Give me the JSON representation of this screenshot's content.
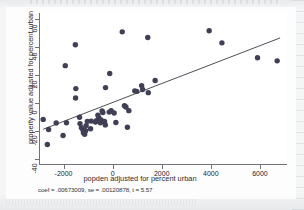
{
  "figure": {
    "note": "coef = .00673009, se = .00120878, t = 5.57"
  },
  "chart_data": {
    "type": "scatter",
    "title": "",
    "xlabel": "popden adjusted for percent urban",
    "ylabel": "property value adjusted for percent urban",
    "xlim": [
      -3000,
      7100
    ],
    "ylim": [
      -44,
      64
    ],
    "xticks": [
      -2000,
      0,
      2000,
      4000,
      6000
    ],
    "xtick_labels": [
      "-2000",
      "0",
      "2000",
      "4000",
      "6000"
    ],
    "yticks": [
      -40,
      -20,
      0,
      20,
      40,
      60
    ],
    "ytick_labels": [
      "-40",
      "-20",
      "0",
      "20",
      "40",
      "60"
    ],
    "grid": false,
    "legend": "none",
    "marker_color": "#3f3f55",
    "line_color": "#3a3a44",
    "fit_line": {
      "label": "linear fit",
      "coef": 0.00673009,
      "se": 0.00120878,
      "t": 5.57,
      "x_start": -2830,
      "y_start": -18.6,
      "x_end": 6820,
      "y_end": 46.3
    },
    "points": [
      {
        "x": -2830,
        "y": -11.6
      },
      {
        "x": -2660,
        "y": -29.4
      },
      {
        "x": -2610,
        "y": -18.8
      },
      {
        "x": -2300,
        "y": -14.2
      },
      {
        "x": -2020,
        "y": -23.0
      },
      {
        "x": -1930,
        "y": 26.6
      },
      {
        "x": -1880,
        "y": -14.0
      },
      {
        "x": -1520,
        "y": 41.4
      },
      {
        "x": -1500,
        "y": 10.3
      },
      {
        "x": -1510,
        "y": 3.6
      },
      {
        "x": -1350,
        "y": -10.1
      },
      {
        "x": -1330,
        "y": -14.6
      },
      {
        "x": -1270,
        "y": -17.5
      },
      {
        "x": -1210,
        "y": -19.0
      },
      {
        "x": -1190,
        "y": -21.1
      },
      {
        "x": -1160,
        "y": -20.0
      },
      {
        "x": -1140,
        "y": -22.2
      },
      {
        "x": -1100,
        "y": -19.7
      },
      {
        "x": -1080,
        "y": -16.0
      },
      {
        "x": -1030,
        "y": -13.0
      },
      {
        "x": -900,
        "y": -18.2
      },
      {
        "x": -870,
        "y": -12.8
      },
      {
        "x": -700,
        "y": -13.4
      },
      {
        "x": -660,
        "y": -12.6
      },
      {
        "x": -600,
        "y": -8.7
      },
      {
        "x": -560,
        "y": -10.5
      },
      {
        "x": -520,
        "y": -12.2
      },
      {
        "x": -500,
        "y": -14.0
      },
      {
        "x": -470,
        "y": -12.0
      },
      {
        "x": -430,
        "y": -5.6
      },
      {
        "x": -400,
        "y": -6.7
      },
      {
        "x": -330,
        "y": -13.1
      },
      {
        "x": -300,
        "y": -15.5
      },
      {
        "x": -290,
        "y": 11.0
      },
      {
        "x": -140,
        "y": -6.4
      },
      {
        "x": -120,
        "y": 21.0
      },
      {
        "x": -60,
        "y": -5.5
      },
      {
        "x": 60,
        "y": -7.0
      },
      {
        "x": 130,
        "y": -13.8
      },
      {
        "x": 390,
        "y": 50.6
      },
      {
        "x": 480,
        "y": -1.9
      },
      {
        "x": 540,
        "y": -2.8
      },
      {
        "x": 600,
        "y": -17.2
      },
      {
        "x": 660,
        "y": -5.4
      },
      {
        "x": 900,
        "y": 8.7
      },
      {
        "x": 980,
        "y": 8.3
      },
      {
        "x": 1180,
        "y": 12.4
      },
      {
        "x": 1220,
        "y": 9.6
      },
      {
        "x": 1430,
        "y": 46.6
      },
      {
        "x": 1450,
        "y": 7.4
      },
      {
        "x": 1730,
        "y": 16.0
      },
      {
        "x": 3930,
        "y": 51.4
      },
      {
        "x": 4450,
        "y": 42.8
      },
      {
        "x": 5900,
        "y": 32.2
      },
      {
        "x": 6700,
        "y": 30.0
      }
    ]
  }
}
